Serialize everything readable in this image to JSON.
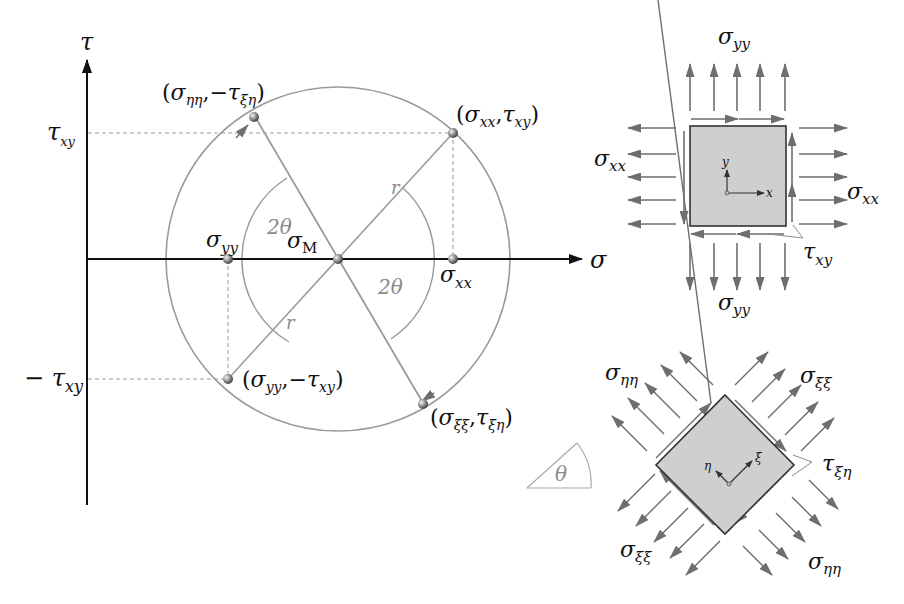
{
  "diagram": {
    "mohr_circle": {
      "axes": {
        "x_label": "σ",
        "y_label": "τ",
        "y_tick_pos": {
          "base": "τ",
          "sub": "xy"
        },
        "y_tick_neg": {
          "prefix": "− ",
          "base": "τ",
          "sub": "xy"
        }
      },
      "center_label": {
        "base": "σ",
        "sub": "M"
      },
      "radius_label_1": "r",
      "radius_label_2": "r",
      "angle_label_1": "2θ",
      "angle_label_2": "2θ",
      "axis_point_left": {
        "base": "σ",
        "sub": "yy"
      },
      "axis_point_right": {
        "base": "σ",
        "sub": "xx"
      },
      "point_A": {
        "open": "(",
        "b1": "σ",
        "s1": "xx",
        "sep": ",",
        "b2": "τ",
        "s2": "xy",
        "close": ")"
      },
      "point_B": {
        "open": "(",
        "b1": "σ",
        "s1": "yy",
        "sep": ",−",
        "b2": "τ",
        "s2": "xy",
        "close": ")"
      },
      "point_C": {
        "open": "(",
        "b1": "σ",
        "s1": "ηη",
        "sep": ",−",
        "b2": "τ",
        "s2": "ξη",
        "close": ")"
      },
      "point_D": {
        "open": "(",
        "b1": "σ",
        "s1": "ξξ",
        "sep": ",",
        "b2": "τ",
        "s2": "ξη",
        "close": ")"
      }
    },
    "element_xy": {
      "top": {
        "base": "σ",
        "sub": "yy"
      },
      "bottom": {
        "base": "σ",
        "sub": "yy"
      },
      "left": {
        "base": "σ",
        "sub": "xx"
      },
      "right": {
        "base": "σ",
        "sub": "xx"
      },
      "shear": {
        "base": "τ",
        "sub": "xy"
      },
      "axis_x": "x",
      "axis_y": "y"
    },
    "element_rotated": {
      "top_left": {
        "base": "σ",
        "sub": "ηη"
      },
      "top_right": {
        "base": "σ",
        "sub": "ξξ"
      },
      "bottom_left": {
        "base": "σ",
        "sub": "ξξ"
      },
      "bottom_right": {
        "base": "σ",
        "sub": "ηη"
      },
      "shear": {
        "base": "τ",
        "sub": "ξη"
      },
      "axis_xi": "ξ",
      "axis_eta": "η"
    },
    "rotation_indicator": {
      "label": "θ"
    },
    "colors": {
      "axis": "#111111",
      "circle": "#9a9a9a",
      "arrow": "#6e6e6e",
      "element_fill": "#cfcfcf",
      "element_stroke": "#333333",
      "dashed": "#9a9a9a"
    }
  }
}
